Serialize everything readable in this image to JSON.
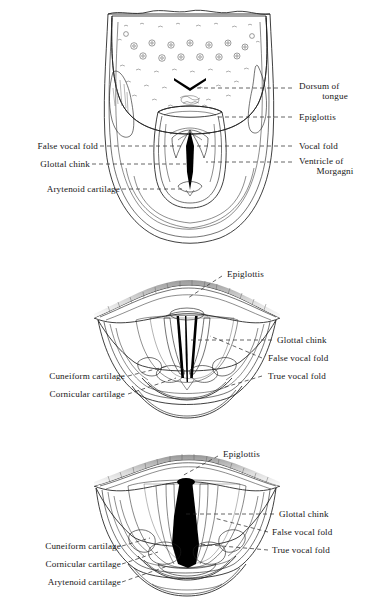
{
  "plate": {
    "background_color": "#ffffff",
    "ink_color": "#1d1d1d",
    "figure_count": 3,
    "subject": "laryngoscopic views of the larynx and tongue"
  },
  "figures": [
    {
      "id": "figure-1",
      "name": "tongue-and-larynx-mirror-view",
      "labels_left": [
        {
          "text": "False vocal fold",
          "target": "false-vocal-fold"
        },
        {
          "text": "Glottal chink",
          "target": "glottal-chink"
        },
        {
          "text": "Arytenoid cartilage",
          "target": "arytenoid-cartilage"
        }
      ],
      "labels_right": [
        {
          "text": "Dorsum of tongue",
          "line1": "Dorsum of",
          "line2": "tongue",
          "target": "dorsum-of-tongue"
        },
        {
          "text": "Epiglottis",
          "line1": "Epiglottis",
          "line2": "",
          "target": "epiglottis"
        },
        {
          "text": "Vocal fold",
          "line1": "Vocal fold",
          "line2": "",
          "target": "vocal-fold"
        },
        {
          "text": "Ventricle of Morgagni",
          "line1": "Ventricle of",
          "line2": "Morgagni",
          "target": "ventricle-of-morgagni"
        }
      ]
    },
    {
      "id": "figure-2",
      "name": "larynx-closed-glottis-view",
      "labels_top": [
        {
          "text": "Epiglottis",
          "target": "epiglottis"
        }
      ],
      "labels_left": [
        {
          "text": "Cuneiform cartilage",
          "target": "cuneiform-cartilage"
        },
        {
          "text": "Cornicular cartilage",
          "target": "cornicular-cartilage"
        }
      ],
      "labels_right": [
        {
          "text": "Glottal chink",
          "target": "glottal-chink"
        },
        {
          "text": "False vocal fold",
          "target": "false-vocal-fold"
        },
        {
          "text": "True vocal fold",
          "target": "true-vocal-fold"
        }
      ]
    },
    {
      "id": "figure-3",
      "name": "larynx-open-glottis-view",
      "labels_top": [
        {
          "text": "Epiglottis",
          "target": "epiglottis"
        }
      ],
      "labels_left": [
        {
          "text": "Cuneiform cartilage",
          "target": "cuneiform-cartilage"
        },
        {
          "text": "Cornicular cartilage",
          "target": "cornicular-cartilage"
        },
        {
          "text": "Arytenoid cartilage",
          "target": "arytenoid-cartilage"
        }
      ],
      "labels_right": [
        {
          "text": "Glottal chink",
          "target": "glottal-chink"
        },
        {
          "text": "False vocal fold",
          "target": "false-vocal-fold"
        },
        {
          "text": "True vocal fold",
          "target": "true-vocal-fold"
        }
      ]
    }
  ]
}
